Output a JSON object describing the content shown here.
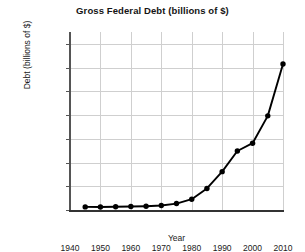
{
  "chart_data": {
    "type": "line",
    "title": "Gross Federal Debt (billions of $)",
    "xlabel": "Year",
    "ylabel": "Debt (billions of $)",
    "xlim": [
      1940,
      2010
    ],
    "ylim": [
      0,
      15000
    ],
    "grid": true,
    "legend": "none",
    "x_ticks": [
      "1940",
      "1950",
      "1960",
      "1970",
      "1980",
      "1990",
      "2000",
      "2010"
    ],
    "x_tick_values": [
      1940,
      1950,
      1960,
      1970,
      1980,
      1990,
      2000,
      2010
    ],
    "y_ticks": [
      "0",
      "2,000",
      "4,000",
      "6,000",
      "8,000",
      "10,000",
      "12,000",
      "14,000"
    ],
    "y_tick_values": [
      0,
      2000,
      4000,
      6000,
      8000,
      10000,
      12000,
      14000
    ],
    "x": [
      1945,
      1950,
      1955,
      1960,
      1965,
      1970,
      1975,
      1980,
      1985,
      1990,
      1995,
      2000,
      2005,
      2010
    ],
    "values": [
      260,
      257,
      274,
      291,
      322,
      381,
      542,
      909,
      1817,
      3233,
      4974,
      5629,
      7933,
      12300
    ],
    "marker": "circle",
    "line_color": "#000000",
    "grid_color": "#cfcfcf",
    "background": "#ffffff"
  }
}
